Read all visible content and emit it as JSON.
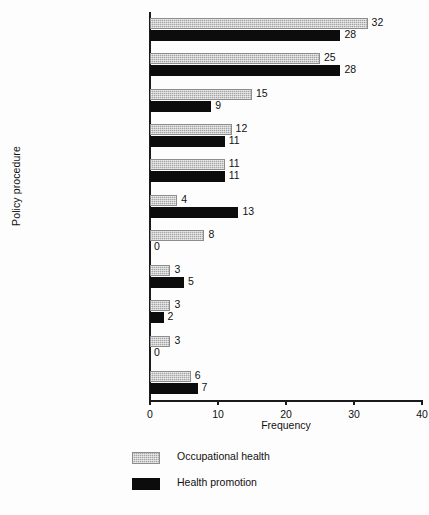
{
  "chart_data": {
    "type": "bar",
    "orientation": "horizontal",
    "title": "",
    "xlabel": "Frequency",
    "ylabel": "Policy procedure",
    "xlim": [
      0,
      40
    ],
    "xticks": [
      0,
      10,
      20,
      30,
      40
    ],
    "xticklabels": [
      "0",
      "10",
      "20",
      "30",
      "40"
    ],
    "grid": false,
    "legend_position": "bottom-left",
    "categories": [
      "Smoking",
      "Alcohol",
      "Lay/coronary",
      "Healthy eating",
      "HIV/AIDS",
      "Exercise",
      "Healthy lifestyle",
      "Stress/mental health",
      "Health and safety",
      "Pre-retirement",
      "Others"
    ],
    "series": [
      {
        "name": "Occupational health",
        "color": "#a6a6a6",
        "values": [
          32,
          25,
          15,
          12,
          11,
          4,
          8,
          3,
          3,
          3,
          6
        ],
        "labels": [
          "32",
          "25",
          "15",
          "12",
          "11",
          "4",
          "8",
          "3",
          "3",
          "3",
          "6"
        ]
      },
      {
        "name": "Health promotion",
        "color": "#0c0c0c",
        "values": [
          28,
          28,
          9,
          11,
          11,
          13,
          0,
          5,
          2,
          0,
          7
        ],
        "labels": [
          "28",
          "28",
          "9",
          "11",
          "11",
          "13",
          "0",
          "5",
          "2",
          "0",
          "7"
        ]
      }
    ]
  },
  "legend": {
    "items": [
      {
        "label": "Occupational health",
        "key": "oh"
      },
      {
        "label": "Health promotion",
        "key": "hp"
      }
    ]
  }
}
